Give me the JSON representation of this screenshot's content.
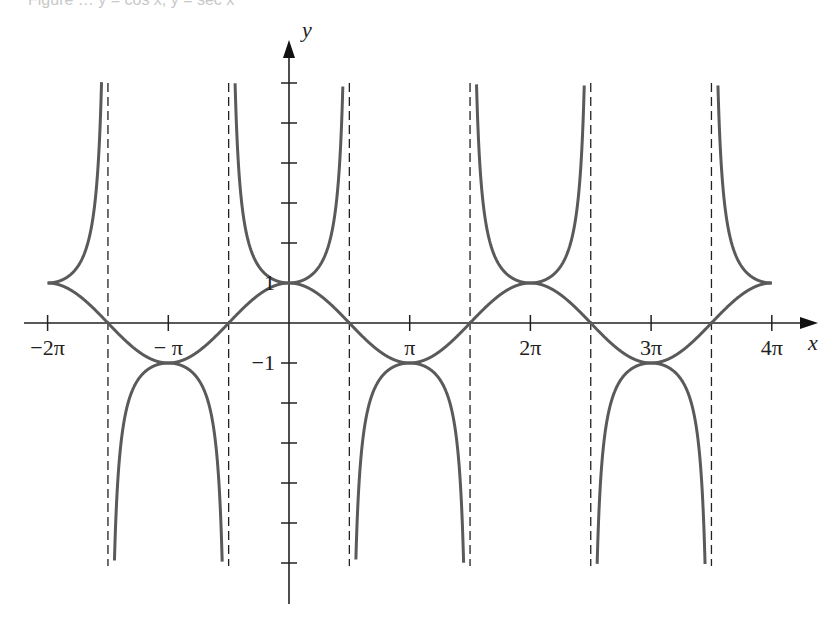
{
  "caption": "Figure … y = cos x, y = sec x",
  "chart_data": {
    "type": "line",
    "title": "",
    "xlabel": "x",
    "ylabel": "y",
    "xlim_rad": [
      -6.2832,
      12.5664
    ],
    "ylim": [
      -7,
      6
    ],
    "x_ticks": [
      {
        "value": -6.2832,
        "label": "−2π"
      },
      {
        "value": -3.1416,
        "label": "− π"
      },
      {
        "value": 3.1416,
        "label": "π"
      },
      {
        "value": 6.2832,
        "label": "2π"
      },
      {
        "value": 9.4248,
        "label": "3π"
      },
      {
        "value": 12.5664,
        "label": "4π"
      }
    ],
    "y_ticks": [
      {
        "value": 6,
        "label": ""
      },
      {
        "value": 5,
        "label": ""
      },
      {
        "value": 4,
        "label": ""
      },
      {
        "value": 3,
        "label": ""
      },
      {
        "value": 2,
        "label": ""
      },
      {
        "value": 1,
        "label": "1"
      },
      {
        "value": -1,
        "label": "−1"
      },
      {
        "value": -2,
        "label": ""
      },
      {
        "value": -3,
        "label": ""
      },
      {
        "value": -4,
        "label": ""
      },
      {
        "value": -5,
        "label": ""
      },
      {
        "value": -6,
        "label": ""
      }
    ],
    "series": [
      {
        "name": "y = cos x",
        "function": "cos",
        "domain": [
          -6.2832,
          12.5664
        ],
        "color": "#5a5a5a"
      },
      {
        "name": "y = sec x",
        "function": "sec",
        "domain": [
          -6.2832,
          12.5664
        ],
        "clip_y": [
          -6,
          6
        ],
        "color": "#5a5a5a"
      }
    ],
    "asymptotes": {
      "style": "dashed",
      "color": "#222222",
      "x_values": [
        -4.7124,
        -1.5708,
        1.5708,
        4.7124,
        7.854,
        10.9956
      ],
      "labels": [
        "−3π/2",
        "−π/2",
        "π/2",
        "3π/2",
        "5π/2",
        "7π/2"
      ]
    },
    "key_points": [
      {
        "x": -6.2832,
        "y": 1
      },
      {
        "x": -3.1416,
        "y": -1
      },
      {
        "x": 0,
        "y": 1
      },
      {
        "x": 3.1416,
        "y": -1
      },
      {
        "x": 6.2832,
        "y": 1
      },
      {
        "x": 9.4248,
        "y": -1
      },
      {
        "x": 12.5664,
        "y": 1
      }
    ],
    "grid": false,
    "legend": "none"
  },
  "layout": {
    "origin_px": [
      289,
      323
    ],
    "px_per_pi": 120.7,
    "px_per_unit_y": 40
  }
}
